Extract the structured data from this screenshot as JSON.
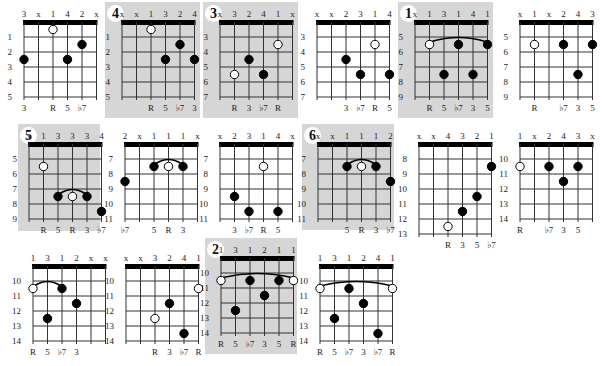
{
  "strings": 6,
  "fret_rows": 5,
  "diagrams": [
    {
      "id": "d1",
      "x": 4,
      "y": 2,
      "w": 100,
      "h": 112,
      "shaded": false,
      "badge": null,
      "fingers": [
        "3",
        "x",
        "1",
        "4",
        "2",
        "x"
      ],
      "frets": [
        1,
        2,
        3,
        4,
        5
      ],
      "dots": [
        {
          "s": 3,
          "f": 1,
          "open": true
        },
        {
          "s": 5,
          "f": 2
        },
        {
          "s": 1,
          "f": 3
        },
        {
          "s": 4,
          "f": 3
        }
      ],
      "barre": null,
      "intervals": [
        "3",
        "",
        "R",
        "5",
        "♭7",
        ""
      ]
    },
    {
      "id": "d2",
      "x": 105,
      "y": 2,
      "w": 95,
      "h": 116,
      "shaded": true,
      "badge": "4",
      "fingers": [
        "x",
        "x",
        "1",
        "3",
        "2",
        "4"
      ],
      "frets": [
        1,
        2,
        3,
        4,
        5
      ],
      "dots": [
        {
          "s": 3,
          "f": 1,
          "open": true
        },
        {
          "s": 5,
          "f": 2
        },
        {
          "s": 4,
          "f": 3
        },
        {
          "s": 6,
          "f": 3
        }
      ],
      "barre": null,
      "intervals": [
        "",
        "",
        "R",
        "5",
        "♭7",
        "3"
      ]
    },
    {
      "id": "d3",
      "x": 203,
      "y": 2,
      "w": 95,
      "h": 116,
      "shaded": true,
      "badge": "3",
      "fingers": [
        "x",
        "3",
        "2",
        "4",
        "1",
        "x"
      ],
      "frets": [
        3,
        4,
        5,
        6,
        7
      ],
      "dots": [
        {
          "s": 5,
          "f": 2,
          "open": true
        },
        {
          "s": 3,
          "f": 3
        },
        {
          "s": 2,
          "f": 4,
          "open": true
        },
        {
          "s": 4,
          "f": 4
        }
      ],
      "barre": null,
      "intervals": [
        "",
        "R",
        "3",
        "♭7",
        "R",
        ""
      ]
    },
    {
      "id": "d4",
      "x": 300,
      "y": 2,
      "w": 95,
      "h": 112,
      "shaded": false,
      "badge": null,
      "fingers": [
        "x",
        "x",
        "2",
        "3",
        "1",
        "4"
      ],
      "frets": [
        3,
        4,
        5,
        6,
        7
      ],
      "dots": [
        {
          "s": 5,
          "f": 2,
          "open": true
        },
        {
          "s": 3,
          "f": 3
        },
        {
          "s": 4,
          "f": 4
        },
        {
          "s": 6,
          "f": 4
        }
      ],
      "barre": null,
      "intervals": [
        "",
        "",
        "3",
        "♭7",
        "R",
        "5"
      ]
    },
    {
      "id": "d5",
      "x": 398,
      "y": 2,
      "w": 95,
      "h": 116,
      "shaded": true,
      "badge": "1",
      "fingers": [
        "x",
        "1",
        "3",
        "1",
        "4",
        "1"
      ],
      "frets": [
        5,
        6,
        7,
        8,
        9
      ],
      "dots": [
        {
          "s": 2,
          "f": 2,
          "open": true
        },
        {
          "s": 4,
          "f": 2
        },
        {
          "s": 6,
          "f": 2
        },
        {
          "s": 3,
          "f": 4
        },
        {
          "s": 5,
          "f": 4
        }
      ],
      "barre": {
        "from": 2,
        "to": 6,
        "f": 2
      },
      "intervals": [
        "",
        "R",
        "5",
        "♭7",
        "3",
        "5"
      ]
    },
    {
      "id": "d6",
      "x": 500,
      "y": 2,
      "w": 100,
      "h": 112,
      "shaded": false,
      "badge": null,
      "fingers": [
        "x",
        "1",
        "x",
        "2",
        "4",
        "3"
      ],
      "frets": [
        5,
        6,
        7,
        8,
        9
      ],
      "dots": [
        {
          "s": 2,
          "f": 2,
          "open": true
        },
        {
          "s": 4,
          "f": 2
        },
        {
          "s": 6,
          "f": 2
        },
        {
          "s": 5,
          "f": 4
        }
      ],
      "barre": null,
      "intervals": [
        "",
        "R",
        "",
        "♭7",
        "3",
        "5"
      ]
    },
    {
      "id": "d7",
      "x": 18,
      "y": 124,
      "w": 82,
      "h": 107,
      "shaded": true,
      "badge": "5",
      "fingers": [
        "x",
        "1",
        "3",
        "3",
        "3",
        "4"
      ],
      "frets": [
        5,
        6,
        7,
        8,
        9
      ],
      "dots": [
        {
          "s": 2,
          "f": 2,
          "open": true
        },
        {
          "s": 3,
          "f": 4
        },
        {
          "s": 4,
          "f": 4,
          "open": true
        },
        {
          "s": 5,
          "f": 4
        },
        {
          "s": 6,
          "f": 5
        }
      ],
      "barre": {
        "from": 3,
        "to": 5,
        "f": 4
      },
      "intervals": [
        "",
        "R",
        "5",
        "R",
        "3",
        "♭7"
      ]
    },
    {
      "id": "d8",
      "x": 110,
      "y": 124,
      "w": 90,
      "h": 106,
      "shaded": false,
      "badge": null,
      "fingers": [
        "2",
        "x",
        "1",
        "1",
        "1",
        "x"
      ],
      "frets": [
        7,
        8,
        9,
        10,
        11
      ],
      "dots": [
        {
          "s": 1,
          "f": 3
        },
        {
          "s": 3,
          "f": 2
        },
        {
          "s": 4,
          "f": 2,
          "open": true
        },
        {
          "s": 5,
          "f": 2
        }
      ],
      "barre": {
        "from": 3,
        "to": 5,
        "f": 2
      },
      "intervals": [
        "♭7",
        "",
        "5",
        "R",
        "3",
        ""
      ]
    },
    {
      "id": "d9",
      "x": 205,
      "y": 124,
      "w": 90,
      "h": 106,
      "shaded": false,
      "badge": null,
      "fingers": [
        "x",
        "2",
        "3",
        "1",
        "4",
        "x"
      ],
      "frets": [
        7,
        8,
        9,
        10,
        11
      ],
      "dots": [
        {
          "s": 4,
          "f": 2,
          "open": true
        },
        {
          "s": 2,
          "f": 4
        },
        {
          "s": 3,
          "f": 5
        },
        {
          "s": 5,
          "f": 5
        }
      ],
      "barre": null,
      "intervals": [
        "",
        "3",
        "♭7",
        "R",
        "5",
        ""
      ]
    },
    {
      "id": "d10",
      "x": 302,
      "y": 124,
      "w": 92,
      "h": 106,
      "shaded": true,
      "badge": "6",
      "fingers": [
        "x",
        "x",
        "1",
        "1",
        "1",
        "2"
      ],
      "frets": [
        7,
        8,
        9,
        10,
        11
      ],
      "dots": [
        {
          "s": 3,
          "f": 2
        },
        {
          "s": 4,
          "f": 2,
          "open": true
        },
        {
          "s": 5,
          "f": 2
        },
        {
          "s": 6,
          "f": 3
        }
      ],
      "barre": {
        "from": 3,
        "to": 5,
        "f": 2
      },
      "intervals": [
        "",
        "",
        "5",
        "R",
        "3",
        "♭7"
      ]
    },
    {
      "id": "d11",
      "x": 400,
      "y": 124,
      "w": 98,
      "h": 116,
      "shaded": false,
      "badge": null,
      "fingers": [
        "x",
        "x",
        "4",
        "3",
        "2",
        "1"
      ],
      "frets": [
        8,
        9,
        10,
        11,
        12,
        13
      ],
      "dots": [
        {
          "s": 6,
          "f": 2
        },
        {
          "s": 5,
          "f": 4
        },
        {
          "s": 4,
          "f": 5
        },
        {
          "s": 3,
          "f": 6,
          "open": true
        }
      ],
      "barre": null,
      "intervals": [
        "",
        "",
        "R",
        "3",
        "5",
        "♭7"
      ]
    },
    {
      "id": "d12",
      "x": 500,
      "y": 124,
      "w": 100,
      "h": 106,
      "shaded": false,
      "badge": null,
      "fingers": [
        "1",
        "x",
        "2",
        "4",
        "3",
        "x"
      ],
      "frets": [
        10,
        11,
        12,
        13,
        14
      ],
      "dots": [
        {
          "s": 1,
          "f": 2,
          "open": true
        },
        {
          "s": 3,
          "f": 2
        },
        {
          "s": 5,
          "f": 2
        },
        {
          "s": 4,
          "f": 3
        }
      ],
      "barre": null,
      "intervals": [
        "R",
        "",
        "♭7",
        "3",
        "5",
        ""
      ]
    },
    {
      "id": "d13",
      "x": 18,
      "y": 246,
      "w": 90,
      "h": 108,
      "shaded": false,
      "badge": null,
      "fingers": [
        "1",
        "3",
        "1",
        "2",
        "x",
        "x"
      ],
      "frets": [
        10,
        11,
        12,
        13,
        14
      ],
      "dots": [
        {
          "s": 1,
          "f": 2,
          "open": true
        },
        {
          "s": 3,
          "f": 2
        },
        {
          "s": 4,
          "f": 3
        },
        {
          "s": 2,
          "f": 4
        }
      ],
      "barre": {
        "from": 1,
        "to": 3,
        "f": 2
      },
      "intervals": [
        "R",
        "5",
        "♭7",
        "3",
        "",
        ""
      ]
    },
    {
      "id": "d14",
      "x": 110,
      "y": 246,
      "w": 92,
      "h": 108,
      "shaded": false,
      "badge": null,
      "fingers": [
        "x",
        "x",
        "3",
        "2",
        "4",
        "1"
      ],
      "frets": [
        10,
        11,
        12,
        13,
        14
      ],
      "dots": [
        {
          "s": 6,
          "f": 2,
          "open": true
        },
        {
          "s": 4,
          "f": 3
        },
        {
          "s": 3,
          "f": 4,
          "open": true
        },
        {
          "s": 5,
          "f": 5
        }
      ],
      "barre": null,
      "intervals": [
        "",
        "",
        "R",
        "3",
        "♭7",
        "R"
      ]
    },
    {
      "id": "d15",
      "x": 205,
      "y": 238,
      "w": 92,
      "h": 116,
      "shaded": true,
      "badge": "2",
      "fingers": [
        "1",
        "3",
        "1",
        "2",
        "1",
        "1"
      ],
      "frets": [
        10,
        11,
        12,
        13,
        14
      ],
      "dots": [
        {
          "s": 1,
          "f": 2,
          "open": true
        },
        {
          "s": 3,
          "f": 2
        },
        {
          "s": 5,
          "f": 2
        },
        {
          "s": 6,
          "f": 2,
          "open": true
        },
        {
          "s": 4,
          "f": 3
        },
        {
          "s": 2,
          "f": 4
        }
      ],
      "barre": {
        "from": 1,
        "to": 6,
        "f": 2
      },
      "intervals": [
        "R",
        "5",
        "♭7",
        "3",
        "5",
        "R"
      ]
    },
    {
      "id": "d16",
      "x": 303,
      "y": 246,
      "w": 95,
      "h": 108,
      "shaded": false,
      "badge": null,
      "fingers": [
        "1",
        "3",
        "1",
        "2",
        "4",
        "1"
      ],
      "frets": [
        10,
        11,
        12,
        13,
        14
      ],
      "dots": [
        {
          "s": 1,
          "f": 2,
          "open": true
        },
        {
          "s": 6,
          "f": 2,
          "open": true
        },
        {
          "s": 3,
          "f": 2
        },
        {
          "s": 4,
          "f": 3
        },
        {
          "s": 2,
          "f": 4
        },
        {
          "s": 5,
          "f": 5
        }
      ],
      "barre": {
        "from": 1,
        "to": 6,
        "f": 2
      },
      "intervals": [
        "R",
        "5",
        "♭7",
        "3",
        "♭7",
        "R"
      ]
    }
  ]
}
